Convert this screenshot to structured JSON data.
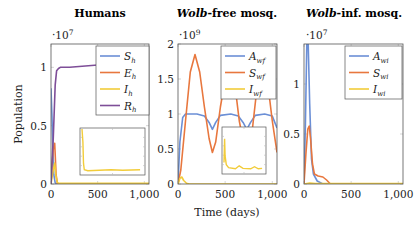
{
  "figure": {
    "xlabel": "Time (days)",
    "ylabel": "Population"
  },
  "colors": {
    "blue": "#6b8fd6",
    "orange": "#e8773e",
    "yellow": "#f2cc3a",
    "purple": "#7e4e98"
  },
  "chart_data": [
    {
      "type": "line",
      "title": "Humans",
      "scale_label": "·10^7",
      "scale_base": "·10",
      "scale_exp": "7",
      "xlabel": "Time (days)",
      "ylabel": "Population",
      "xlim": [
        0,
        1050
      ],
      "ylim": [
        0,
        1.2
      ],
      "xticks": [
        "0",
        "500",
        "1,000"
      ],
      "yticks": [
        "0",
        "0.5",
        "1"
      ],
      "legend": [
        "S_h",
        "E_h",
        "I_h",
        "R_h"
      ],
      "series": [
        {
          "name": "S_h",
          "color": "blue",
          "x": [
            0,
            10,
            20,
            30,
            45,
            60,
            80,
            1050
          ],
          "y": [
            0.82,
            0.6,
            0.3,
            0.08,
            0.01,
            0.0,
            0.0,
            0.0
          ]
        },
        {
          "name": "E_h",
          "color": "orange",
          "x": [
            0,
            10,
            25,
            40,
            55,
            70,
            1050
          ],
          "y": [
            0.0,
            0.15,
            0.3,
            0.35,
            0.08,
            0.0,
            0.0
          ]
        },
        {
          "name": "I_h",
          "color": "yellow",
          "x": [
            0,
            20,
            40,
            55,
            70,
            90,
            1050
          ],
          "y": [
            0.0,
            0.1,
            0.18,
            0.06,
            0.01,
            0.005,
            0.005
          ]
        },
        {
          "name": "R_h",
          "color": "purple",
          "x": [
            0,
            25,
            45,
            60,
            80,
            100,
            200,
            500,
            1050
          ],
          "y": [
            0.0,
            0.4,
            0.85,
            0.97,
            0.99,
            1.0,
            1.0,
            1.02,
            1.04
          ]
        }
      ],
      "inset": {
        "series": "I_h",
        "x": [
          0,
          15,
          25,
          40,
          100,
          300,
          500,
          700,
          1000
        ],
        "y": [
          1.0,
          0.7,
          0.2,
          0.05,
          0.03,
          0.04,
          0.05,
          0.04,
          0.05
        ]
      }
    },
    {
      "type": "line",
      "title_italic": "Wolb",
      "title_rest": "-free mosq.",
      "title": "Wolb-free mosq.",
      "scale_label": "·10^9",
      "scale_base": "·10",
      "scale_exp": "9",
      "xlim": [
        0,
        1050
      ],
      "ylim": [
        0,
        2.0
      ],
      "xticks": [
        "0",
        "500",
        "1,000"
      ],
      "yticks": [
        "0",
        "0.5",
        "1",
        "1.5",
        "2"
      ],
      "legend": [
        "A_wf",
        "S_wf",
        "I_wf"
      ],
      "series": [
        {
          "name": "A_wf",
          "color": "blue",
          "x": [
            0,
            20,
            50,
            80,
            200,
            280,
            330,
            365,
            400,
            450,
            560,
            640,
            690,
            730,
            770,
            820,
            920,
            1000,
            1050
          ],
          "y": [
            0.0,
            0.6,
            0.95,
            1.0,
            1.0,
            0.97,
            0.88,
            0.78,
            0.88,
            0.98,
            1.0,
            0.97,
            0.88,
            0.78,
            0.88,
            0.98,
            1.0,
            0.97,
            0.8
          ]
        },
        {
          "name": "S_wf",
          "color": "orange",
          "x": [
            0,
            30,
            80,
            130,
            180,
            230,
            280,
            330,
            365,
            400,
            450,
            500,
            540,
            600,
            650,
            700,
            740,
            790,
            840,
            900,
            960,
            1000,
            1050
          ],
          "y": [
            0.0,
            0.2,
            0.9,
            1.6,
            1.85,
            1.6,
            1.1,
            0.65,
            0.45,
            0.6,
            1.1,
            1.5,
            1.75,
            1.45,
            0.9,
            0.55,
            0.5,
            0.8,
            1.4,
            1.75,
            1.35,
            0.9,
            0.45
          ]
        },
        {
          "name": "I_wf",
          "color": "yellow",
          "x": [
            0,
            20,
            40,
            60,
            90,
            120,
            1050
          ],
          "y": [
            0.0,
            0.08,
            0.1,
            0.05,
            0.01,
            0.0,
            0.0
          ]
        }
      ],
      "inset": {
        "series": "I_wf",
        "x": [
          0,
          15,
          30,
          60,
          120,
          300,
          400,
          500,
          700,
          800,
          900,
          1000
        ],
        "y": [
          0.2,
          0.75,
          0.35,
          0.15,
          0.08,
          0.05,
          0.12,
          0.06,
          0.05,
          0.1,
          0.05,
          0.06
        ]
      }
    },
    {
      "type": "line",
      "title_italic": "Wolb",
      "title_rest": "-inf. mosq.",
      "title": "Wolb-inf. mosq.",
      "scale_label": "·10^7",
      "scale_base": "·10",
      "scale_exp": "7",
      "xlim": [
        0,
        1050
      ],
      "ylim": [
        0,
        1.4
      ],
      "xticks": [
        "0",
        "500",
        "1,000"
      ],
      "yticks": [
        "0",
        "0.5",
        "1"
      ],
      "legend": [
        "A_wi",
        "S_wi",
        "I_wi"
      ],
      "series": [
        {
          "name": "A_wi",
          "color": "blue",
          "x": [
            0,
            15,
            30,
            45,
            60,
            80,
            100,
            140,
            200,
            1050
          ],
          "y": [
            0.0,
            0.6,
            1.4,
            1.4,
            0.8,
            0.25,
            0.1,
            0.03,
            0.0,
            0.0
          ]
        },
        {
          "name": "S_wi",
          "color": "orange",
          "x": [
            0,
            20,
            40,
            55,
            70,
            90,
            110,
            150,
            200,
            240,
            280,
            1050
          ],
          "y": [
            0.0,
            0.3,
            0.55,
            0.58,
            0.45,
            0.2,
            0.1,
            0.08,
            0.07,
            0.04,
            0.0,
            0.0
          ]
        },
        {
          "name": "I_wi",
          "color": "yellow",
          "x": [
            0,
            60,
            120,
            1050
          ],
          "y": [
            0.0,
            0.01,
            0.005,
            0.005
          ]
        }
      ]
    }
  ]
}
